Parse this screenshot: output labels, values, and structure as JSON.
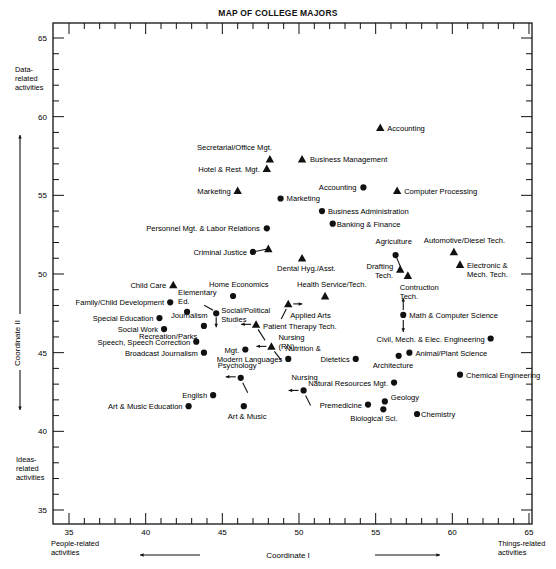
{
  "chart_data": {
    "type": "scatter",
    "title": "MAP OF COLLEGE MAJORS",
    "xlabel": "Coordinate I",
    "ylabel": "Coordinate II",
    "xlim": [
      34,
      66
    ],
    "ylim": [
      34,
      66
    ],
    "x_ticks": [
      35,
      40,
      45,
      50,
      55,
      60,
      65
    ],
    "y_ticks": [
      35,
      40,
      45,
      50,
      55,
      60,
      65
    ],
    "grid": false,
    "annotations": {
      "x_left": "People-related activities",
      "x_right": "Things-related activities",
      "y_top": "Data-related activities",
      "y_bottom": "Ideas-related activities"
    },
    "legend": [
      {
        "marker": "triangle",
        "meaning": "two-year / technical programs"
      },
      {
        "marker": "circle",
        "meaning": "four-year programs"
      }
    ],
    "series": [
      {
        "name": "triangle",
        "points": [
          {
            "label": "Accounting",
            "x": 55.3,
            "y": 59.3
          },
          {
            "label": "Secretarial/Office Mgt.",
            "x": 48.1,
            "y": 57.3
          },
          {
            "label": "Business Management",
            "x": 50.2,
            "y": 57.3
          },
          {
            "label": "Hotel & Rest. Mgt.",
            "x": 47.9,
            "y": 56.7
          },
          {
            "label": "Marketing",
            "x": 46.0,
            "y": 55.3
          },
          {
            "label": "Computer Processing",
            "x": 56.4,
            "y": 55.3
          },
          {
            "label": "Criminal Justice",
            "x": 48.0,
            "y": 51.6
          },
          {
            "label": "Dental Hyg./Asst.",
            "x": 50.2,
            "y": 51.0
          },
          {
            "label": "Automotive/Diesel Tech.",
            "x": 60.1,
            "y": 51.4
          },
          {
            "label": "Electronic & Mech. Tech.",
            "x": 60.5,
            "y": 50.6
          },
          {
            "label": "Drafting Tech.",
            "x": 56.6,
            "y": 50.3
          },
          {
            "label": "Contruction Tech.",
            "x": 57.1,
            "y": 49.9
          },
          {
            "label": "Child Care",
            "x": 41.8,
            "y": 49.3
          },
          {
            "label": "Health Service/Tech.",
            "x": 51.7,
            "y": 48.6
          },
          {
            "label": "Applied Arts",
            "x": 49.3,
            "y": 48.1
          },
          {
            "label": "Patient Therapy Tech.",
            "x": 47.2,
            "y": 46.8
          },
          {
            "label": "Nursing (RN)",
            "x": 48.2,
            "y": 45.4
          }
        ]
      },
      {
        "name": "circle",
        "points": [
          {
            "label": "Accounting",
            "x": 54.2,
            "y": 55.5
          },
          {
            "label": "Marketing",
            "x": 48.8,
            "y": 54.8
          },
          {
            "label": "Business Administration",
            "x": 51.5,
            "y": 54.0
          },
          {
            "label": "Banking & Finance",
            "x": 52.2,
            "y": 53.2
          },
          {
            "label": "Personnel Mgt. & Labor Relations",
            "x": 47.9,
            "y": 52.9
          },
          {
            "label": "Criminal Justice",
            "x": 47.0,
            "y": 51.4
          },
          {
            "label": "Agriculture",
            "x": 56.3,
            "y": 51.2
          },
          {
            "label": "Home Economics",
            "x": 45.7,
            "y": 48.6
          },
          {
            "label": "Family/Child Development",
            "x": 41.6,
            "y": 48.2
          },
          {
            "label": "Elementary Ed.",
            "x": 42.7,
            "y": 47.6
          },
          {
            "label": "Social/Political Studies",
            "x": 44.6,
            "y": 47.5
          },
          {
            "label": "Special Education",
            "x": 40.9,
            "y": 47.2
          },
          {
            "label": "Math & Computer Science",
            "x": 56.8,
            "y": 47.4
          },
          {
            "label": "Journalism",
            "x": 43.8,
            "y": 46.7
          },
          {
            "label": "Social Work",
            "x": 41.2,
            "y": 46.5
          },
          {
            "label": "Civil, Mech. & Elec. Engineering",
            "x": 62.5,
            "y": 45.9
          },
          {
            "label": "Speech, Speech Correction",
            "x": 43.3,
            "y": 45.7
          },
          {
            "label": "Recreation/Parks Mgt.",
            "x": 46.5,
            "y": 45.2
          },
          {
            "label": "Broadcast Journalism",
            "x": 43.8,
            "y": 45.0
          },
          {
            "label": "Animal/Plant Science",
            "x": 57.2,
            "y": 45.0
          },
          {
            "label": "Architecture",
            "x": 56.5,
            "y": 44.8
          },
          {
            "label": "Modern Languages",
            "x": 49.3,
            "y": 44.6
          },
          {
            "label": "Nutrition & Dietetics",
            "x": 53.7,
            "y": 44.6
          },
          {
            "label": "Psychology",
            "x": 46.2,
            "y": 43.4
          },
          {
            "label": "Chemical Engineering",
            "x": 60.5,
            "y": 43.6
          },
          {
            "label": "Natural Resources Mgt.",
            "x": 56.2,
            "y": 43.1
          },
          {
            "label": "Nursing",
            "x": 50.3,
            "y": 42.6
          },
          {
            "label": "English",
            "x": 44.4,
            "y": 42.3
          },
          {
            "label": "Geology",
            "x": 55.6,
            "y": 41.9
          },
          {
            "label": "Premedicine",
            "x": 54.5,
            "y": 41.7
          },
          {
            "label": "Art & Music Education",
            "x": 42.8,
            "y": 41.6
          },
          {
            "label": "Art & Music",
            "x": 46.4,
            "y": 41.6
          },
          {
            "label": "Biological Sci.",
            "x": 55.5,
            "y": 41.4
          },
          {
            "label": "Chemistry",
            "x": 57.7,
            "y": 41.1
          }
        ]
      }
    ]
  },
  "labels": {
    "title": "MAP OF COLLEGE MAJORS",
    "x_axis": "Coordinate I",
    "y_axis": "Coordinate II",
    "y_top": [
      "Data-",
      "related",
      "activities"
    ],
    "y_bottom": [
      "Ideas-",
      "related",
      "activities"
    ],
    "x_left": [
      "People-related",
      "activities"
    ],
    "x_right": [
      "Things-related",
      "activities"
    ]
  }
}
